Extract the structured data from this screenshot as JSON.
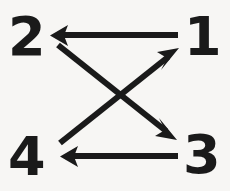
{
  "diagram": {
    "background_color": "#f7f6f4",
    "stroke_color": "#1a1a1a",
    "nodes": [
      {
        "id": "1",
        "label": "1",
        "position": "top-right",
        "x": 200,
        "y": 36
      },
      {
        "id": "2",
        "label": "2",
        "position": "top-left",
        "x": 27,
        "y": 36
      },
      {
        "id": "3",
        "label": "3",
        "position": "bottom-right",
        "x": 201,
        "y": 157
      },
      {
        "id": "4",
        "label": "4",
        "position": "bottom-left",
        "x": 28,
        "y": 157
      }
    ],
    "arrows": [
      {
        "name": "arrow-1-to-2",
        "from": "1",
        "to": "2",
        "kind": "horizontal",
        "direction": "left",
        "x1": 178,
        "y1": 35,
        "x2": 52,
        "y2": 35
      },
      {
        "name": "arrow-2-to-3",
        "from": "2",
        "to": "3",
        "kind": "diagonal",
        "direction": "down-right",
        "x1": 58,
        "y1": 45,
        "x2": 176,
        "y2": 139
      },
      {
        "name": "arrow-4-to-1",
        "from": "4",
        "to": "1",
        "kind": "diagonal",
        "direction": "up-right",
        "x1": 60,
        "y1": 143,
        "x2": 178,
        "y2": 49
      },
      {
        "name": "arrow-3-to-4",
        "from": "3",
        "to": "4",
        "kind": "horizontal",
        "direction": "left",
        "x1": 178,
        "y1": 156,
        "x2": 62,
        "y2": 156
      }
    ],
    "crossing_point": {
      "x": 120,
      "y": 94
    }
  }
}
